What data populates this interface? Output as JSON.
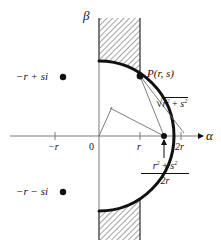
{
  "figure": {
    "axes": {
      "vertical_label": "β",
      "horizontal_label": "α"
    },
    "ticks": [
      {
        "label": "−r",
        "name": "tick-minus-r"
      },
      {
        "label": "0",
        "name": "tick-origin"
      },
      {
        "label": "r",
        "name": "tick-r"
      },
      {
        "label": "2r",
        "name": "tick-2r"
      }
    ],
    "points": [
      {
        "name": "point-minus-r-plus-si",
        "label": "−r + si"
      },
      {
        "name": "point-minus-r-minus-si",
        "label": "−r − si"
      },
      {
        "name": "point-P",
        "label": "P(r, s)"
      }
    ],
    "expressions": {
      "hypotenuse": {
        "radical": "√",
        "radicand_base_1": "r",
        "radicand_sup_1": "2",
        "plus": " + ",
        "radicand_base_2": "s",
        "radicand_sup_2": "2"
      },
      "fraction": {
        "numerator_base_1": "r",
        "numerator_sup_1": "2",
        "numerator_plus": " + ",
        "numerator_base_2": "s",
        "numerator_sup_2": "2",
        "denominator": "2r"
      }
    },
    "colors": {
      "ink": "#111111",
      "axis": "#7a7a7a",
      "hatch": "#8d8d8d",
      "band_fill": "#ffffff",
      "background": "#ffffff"
    }
  }
}
